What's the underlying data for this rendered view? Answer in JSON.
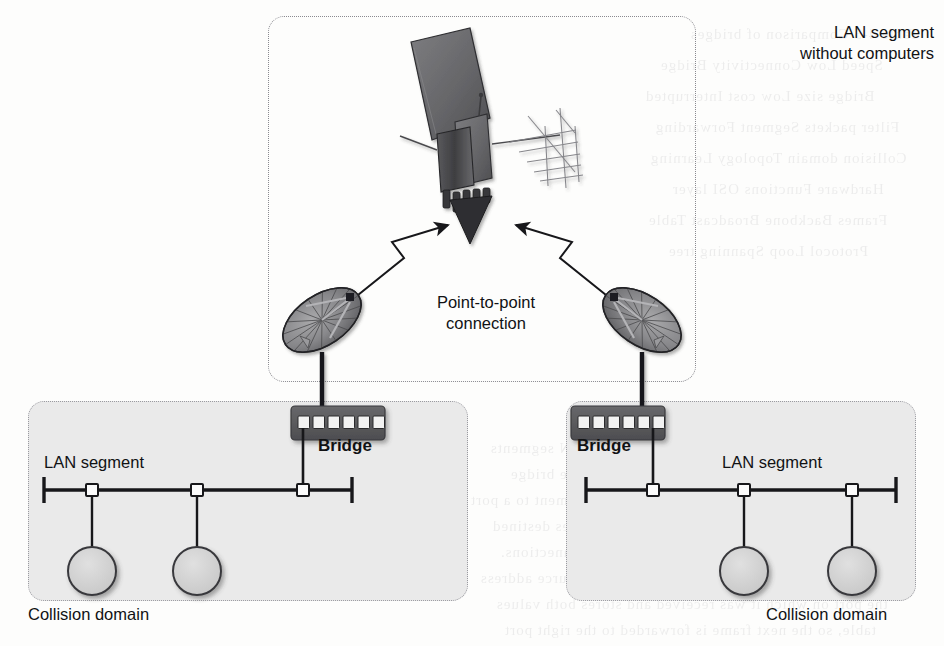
{
  "diagram": {
    "type": "network-topology"
  },
  "panels": {
    "top": {
      "name": "satellite-link-panel",
      "label": "LAN segment\nwithout computers",
      "fill": "#ffffff",
      "border": "#8a8a90"
    },
    "bottom_left": {
      "name": "left-collision-domain-panel",
      "label": "Collision domain",
      "fill": "#eaeaea",
      "border": "#9a9aa0"
    },
    "bottom_right": {
      "name": "right-collision-domain-panel",
      "label": "Collision domain",
      "fill": "#eaeaea",
      "border": "#9a9aa0"
    }
  },
  "labels": {
    "lan_without_computers": "LAN segment\nwithout computers",
    "point_to_point": "Point-to-point\nconnection",
    "bridge_left": "Bridge",
    "bridge_right": "Bridge",
    "lan_segment_left": "LAN segment",
    "lan_segment_right": "LAN segment",
    "collision_domain_left": "Collision domain",
    "collision_domain_right": "Collision domain"
  },
  "devices": {
    "satellite": {
      "icon": "satellite-icon",
      "panels": 1,
      "antennas": 2,
      "thrusters": 5
    },
    "dish_left": {
      "icon": "satellite-dish-icon",
      "facing": "up-right"
    },
    "dish_right": {
      "icon": "satellite-dish-icon",
      "facing": "up-left"
    },
    "bridge_left": {
      "icon": "bridge-icon",
      "ports": 6,
      "uplink_port_index": 2,
      "downlink_port_index": 0,
      "body_color": "#58585a",
      "port_color": "#f2f2f2"
    },
    "bridge_right": {
      "icon": "bridge-icon",
      "ports": 6,
      "uplink_port_index": 3,
      "downlink_port_index": 3,
      "body_color": "#58585a",
      "port_color": "#f2f2f2"
    }
  },
  "bus_left": {
    "name": "left-lan-bus",
    "taps": 3,
    "terminators": 2,
    "computers": 2
  },
  "bus_right": {
    "name": "right-lan-bus",
    "taps": 3,
    "terminators": 2,
    "computers": 2
  },
  "links": {
    "left_wireless": {
      "name": "left-point-to-point-link",
      "style": "lightning-double-arrow"
    },
    "right_wireless": {
      "name": "right-point-to-point-link",
      "style": "lightning-double-arrow"
    }
  },
  "colors": {
    "ink": "#111214",
    "line": "#1b1b1d",
    "node_fill": "#d2d2d2",
    "node_stroke": "#3a3a3c",
    "panel_fill": "#eaeaea",
    "bridge_body": "#58585a",
    "dish_dark": "#6e6e70",
    "dish_light": "#b8b8ba"
  },
  "ghost_text": [
    {
      "text": "Table 4-5  Comparison of bridges",
      "x": 690,
      "y": 26,
      "size": 15
    },
    {
      "text": "Speed    Low    Connectivity  Bridge",
      "x": 660,
      "y": 57,
      "size": 15
    },
    {
      "text": "Bridge size    Low cost    Interrupted",
      "x": 645,
      "y": 88,
      "size": 15
    },
    {
      "text": "Filter packets    Segment    Forwarding",
      "x": 655,
      "y": 119,
      "size": 15
    },
    {
      "text": "Collision domain    Topology    Learning",
      "x": 650,
      "y": 150,
      "size": 15
    },
    {
      "text": "Hardware    Functions    OSI layer",
      "x": 672,
      "y": 181,
      "size": 15
    },
    {
      "text": "Frames    Backbone    Broadcast   Table",
      "x": 648,
      "y": 212,
      "size": 15
    },
    {
      "text": "Protocol    Loop    Spanning tree",
      "x": 668,
      "y": 243,
      "size": 15
    },
    {
      "text": "Transparent Bridges",
      "x": 620,
      "y": 404,
      "size": 16
    },
    {
      "text": "A transparent bridge connects two or more LAN segments",
      "x": 490,
      "y": 440,
      "size": 15
    },
    {
      "text": "table of addresses and their locations. The bridge",
      "x": 510,
      "y": 466,
      "size": 15
    },
    {
      "text": "built over the system, and maps each LAN segment to a port",
      "x": 470,
      "y": 492,
      "size": 15
    },
    {
      "text": "a collision domain and passes only the frames destined",
      "x": 492,
      "y": 518,
      "size": 15
    },
    {
      "text": "segment. This behavior makes for better connections.",
      "x": 500,
      "y": 544,
      "size": 15
    },
    {
      "text": "When a bridge receives a frame, it reads the source address",
      "x": 480,
      "y": 570,
      "size": 15
    },
    {
      "text": "the port on which it was received and stores both values",
      "x": 496,
      "y": 596,
      "size": 15
    },
    {
      "text": "table, so the next frame is forwarded to the right port",
      "x": 504,
      "y": 622,
      "size": 15
    }
  ]
}
